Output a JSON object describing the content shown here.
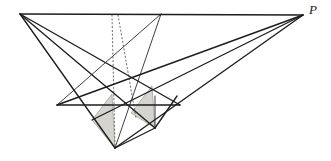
{
  "figure": {
    "width": 331,
    "height": 161,
    "background_color": "#ffffff",
    "stroke_color": "#1d1d1d",
    "shade_color": "#d6d4cf",
    "shade_stroke_color": "#8f8d89",
    "dotted_color": "#7a7876",
    "stroke_width": 1.25,
    "thin_stroke_width": 0.9
  },
  "labels": [
    {
      "id": "P",
      "text": "P",
      "x": 313,
      "y": 14,
      "style": "italic-serif"
    }
  ],
  "points": {
    "A": {
      "name": "left-apex",
      "x": 20,
      "y": 14
    },
    "P": {
      "name": "right-vanishing-point",
      "x": 303,
      "y": 15
    },
    "T": {
      "name": "top-inner-apex",
      "x": 161,
      "y": 14
    },
    "B": {
      "name": "bottom-vertex",
      "x": 115,
      "y": 148
    },
    "L": {
      "name": "left-mid-vertex",
      "x": 57,
      "y": 105
    },
    "C": {
      "name": "center-cross",
      "x": 112,
      "y": 94
    },
    "D": {
      "name": "center-lower-cross",
      "x": 132,
      "y": 112
    },
    "E": {
      "name": "upper-right-cross",
      "x": 152,
      "y": 86
    },
    "F": {
      "name": "right-mid-vertex",
      "x": 180,
      "y": 105
    },
    "G": {
      "name": "lower-right-vertex",
      "x": 155,
      "y": 128
    },
    "H": {
      "name": "right-rail-vertex",
      "x": 177,
      "y": 96
    },
    "K": {
      "name": "inner-edge-vertex",
      "x": 155,
      "y": 96
    },
    "M": {
      "name": "lower-mid-vertex",
      "x": 136,
      "y": 118
    }
  },
  "edges": [
    {
      "name": "top-edge-A-to-P",
      "from": "A",
      "to": "P",
      "kind": "solid"
    },
    {
      "name": "edge-A-to-B",
      "from": "A",
      "to": "B",
      "kind": "solid"
    },
    {
      "name": "edge-A-to-D",
      "from": "A",
      "to": "D",
      "kind": "solid"
    },
    {
      "name": "edge-A-to-F",
      "from": "A",
      "to": "F",
      "kind": "solid"
    },
    {
      "name": "edge-P-to-B",
      "from": "P",
      "to": "B",
      "kind": "solid"
    },
    {
      "name": "edge-P-to-L",
      "from": "P",
      "to": "L",
      "kind": "solid"
    },
    {
      "name": "edge-P-to-C",
      "from": "P",
      "to": "C",
      "kind": "solid"
    },
    {
      "name": "edge-T-to-B",
      "from": "T",
      "to": "B",
      "kind": "thin"
    },
    {
      "name": "edge-T-to-L",
      "from": "T",
      "to": "L",
      "kind": "thin"
    },
    {
      "name": "horizontal-rail-L-to-F",
      "from": "L",
      "to": "F",
      "kind": "solid"
    },
    {
      "name": "edge-B-to-G",
      "from": "B",
      "to": "G",
      "kind": "solid"
    },
    {
      "name": "edge-G-to-H",
      "from": "G",
      "to": "H",
      "kind": "thin"
    },
    {
      "name": "dotted-vertical-from-top",
      "from": "top",
      "to": "B",
      "kind": "dotted"
    },
    {
      "name": "dotted-diagonal-from-top",
      "from": "top",
      "to": "D",
      "kind": "dotted"
    }
  ],
  "shaded_regions": [
    {
      "name": "left-shaded-triangle",
      "fill": "#d6d4cf",
      "vertices": [
        [
          112,
          94
        ],
        [
          115,
          148
        ],
        [
          92,
          120
        ]
      ]
    },
    {
      "name": "right-shaded-triangle",
      "fill": "#d6d4cf",
      "vertices": [
        [
          152,
          86
        ],
        [
          155,
          128
        ],
        [
          131,
          113
        ]
      ]
    }
  ]
}
